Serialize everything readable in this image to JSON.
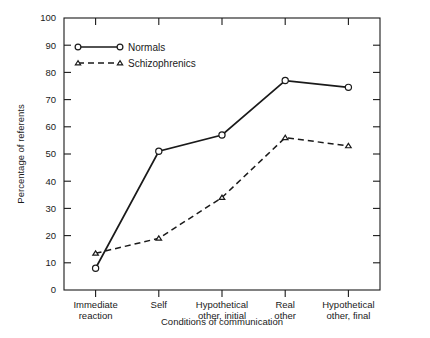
{
  "chart_data": {
    "type": "line",
    "title": "",
    "xlabel": "Conditions of communication",
    "ylabel": "Percentage of referents",
    "categories": [
      "Immediate\nreaction",
      "Self",
      "Hypothetical\nother, initial",
      "Real\nother",
      "Hypothetical\nother, final"
    ],
    "category_lines": [
      [
        "Immediate",
        "reaction"
      ],
      [
        "Self",
        ""
      ],
      [
        "Hypothetical",
        "other, initial"
      ],
      [
        "Real",
        "other"
      ],
      [
        "Hypothetical",
        "other, final"
      ]
    ],
    "series": [
      {
        "name": "Normals",
        "marker": "circle",
        "linestyle": "solid",
        "values": [
          8,
          51,
          57,
          77,
          74.5
        ]
      },
      {
        "name": "Schizophrenics",
        "marker": "triangle",
        "linestyle": "dashed",
        "values": [
          13.5,
          19,
          34,
          56,
          53
        ]
      }
    ],
    "ylim": [
      0,
      100
    ],
    "ytick_values": [
      0,
      10,
      20,
      30,
      40,
      50,
      60,
      70,
      80,
      90,
      100
    ],
    "ytick_labels": [
      "0",
      "10",
      "20",
      "30",
      "40",
      "50",
      "60",
      "70",
      "80",
      "90",
      "100"
    ],
    "grid": false,
    "legend_position": "upper left",
    "colors": {
      "foreground": "#1a1a1a",
      "background": "#ffffff"
    }
  },
  "legend": {
    "entries": [
      {
        "label": "Normals"
      },
      {
        "label": "Schizophrenics"
      }
    ]
  }
}
